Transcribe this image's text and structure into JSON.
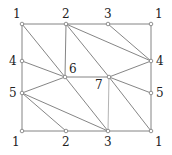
{
  "diagram": {
    "type": "triangulated-grid-graph",
    "nodes": [
      {
        "id": "n1",
        "label": "1",
        "x": 22,
        "y": 24,
        "lx": 13,
        "ly": 18
      },
      {
        "id": "n2",
        "label": "2",
        "x": 66,
        "y": 24,
        "lx": 62,
        "ly": 18
      },
      {
        "id": "n3",
        "label": "3",
        "x": 108,
        "y": 24,
        "lx": 104,
        "ly": 18
      },
      {
        "id": "n4",
        "label": "1",
        "x": 151,
        "y": 24,
        "lx": 155,
        "ly": 18
      },
      {
        "id": "n5",
        "label": "4",
        "x": 22,
        "y": 61,
        "lx": 9,
        "ly": 65
      },
      {
        "id": "n6",
        "label": "4",
        "x": 151,
        "y": 61,
        "lx": 156,
        "ly": 65
      },
      {
        "id": "n7",
        "label": "6",
        "x": 65,
        "y": 77,
        "lx": 69,
        "ly": 73
      },
      {
        "id": "n8",
        "label": "7",
        "x": 109,
        "y": 77,
        "lx": 95,
        "ly": 89
      },
      {
        "id": "n9",
        "label": "5",
        "x": 22,
        "y": 93,
        "lx": 9,
        "ly": 97
      },
      {
        "id": "n10",
        "label": "5",
        "x": 151,
        "y": 93,
        "lx": 156,
        "ly": 97
      },
      {
        "id": "n11",
        "label": "1",
        "x": 22,
        "y": 131,
        "lx": 12,
        "ly": 146
      },
      {
        "id": "n12",
        "label": "2",
        "x": 66,
        "y": 131,
        "lx": 62,
        "ly": 146
      },
      {
        "id": "n13",
        "label": "3",
        "x": 108,
        "y": 131,
        "lx": 104,
        "ly": 146
      },
      {
        "id": "n14",
        "label": "1",
        "x": 151,
        "y": 131,
        "lx": 155,
        "ly": 146
      }
    ],
    "edges": [
      [
        "n1",
        "n2"
      ],
      [
        "n2",
        "n3"
      ],
      [
        "n3",
        "n4"
      ],
      [
        "n4",
        "n6"
      ],
      [
        "n6",
        "n10"
      ],
      [
        "n10",
        "n14"
      ],
      [
        "n11",
        "n12"
      ],
      [
        "n12",
        "n13"
      ],
      [
        "n13",
        "n14"
      ],
      [
        "n1",
        "n5"
      ],
      [
        "n5",
        "n9"
      ],
      [
        "n9",
        "n11"
      ],
      [
        "n1",
        "n7"
      ],
      [
        "n5",
        "n7"
      ],
      [
        "n2",
        "n7"
      ],
      [
        "n7",
        "n13"
      ],
      [
        "n7",
        "n9"
      ],
      [
        "n7",
        "n8"
      ],
      [
        "n2",
        "n8"
      ],
      [
        "n2",
        "n6"
      ],
      [
        "n3",
        "n6"
      ],
      [
        "n8",
        "n6"
      ],
      [
        "n8",
        "n10"
      ],
      [
        "n8",
        "n14"
      ],
      [
        "n9",
        "n12"
      ],
      [
        "n9",
        "n13"
      ]
    ],
    "light_edges": [
      [
        "n8",
        "n13"
      ]
    ]
  }
}
